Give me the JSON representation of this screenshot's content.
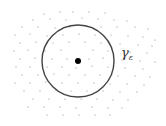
{
  "diagram": {
    "circle": {
      "cx": 78,
      "cy": 61,
      "r": 36,
      "stroke": "#444444",
      "label": "γ",
      "label_sub": "ε"
    },
    "center_point": {
      "cx": 78,
      "cy": 61,
      "r": 3,
      "fill": "#000000"
    },
    "scatter_color": "#888888",
    "scatter_points": [
      [
        44,
        14
      ],
      [
        60,
        12
      ],
      [
        73,
        12
      ],
      [
        89,
        12
      ],
      [
        105,
        13
      ],
      [
        33,
        20
      ],
      [
        50,
        19
      ],
      [
        66,
        20
      ],
      [
        82,
        18
      ],
      [
        98,
        19
      ],
      [
        114,
        20
      ],
      [
        127,
        21
      ],
      [
        22,
        27
      ],
      [
        38,
        27
      ],
      [
        55,
        28
      ],
      [
        70,
        27
      ],
      [
        86,
        26
      ],
      [
        101,
        27
      ],
      [
        117,
        27
      ],
      [
        135,
        27
      ],
      [
        148,
        29
      ],
      [
        15,
        35
      ],
      [
        30,
        34
      ],
      [
        47,
        36
      ],
      [
        63,
        35
      ],
      [
        79,
        34
      ],
      [
        95,
        35
      ],
      [
        111,
        35
      ],
      [
        128,
        36
      ],
      [
        143,
        37
      ],
      [
        155,
        40
      ],
      [
        20,
        43
      ],
      [
        36,
        42
      ],
      [
        53,
        43
      ],
      [
        69,
        42
      ],
      [
        85,
        42
      ],
      [
        101,
        43
      ],
      [
        120,
        44
      ],
      [
        138,
        45
      ],
      [
        152,
        46
      ],
      [
        14,
        51
      ],
      [
        28,
        50
      ],
      [
        45,
        51
      ],
      [
        61,
        50
      ],
      [
        93,
        50
      ],
      [
        108,
        51
      ],
      [
        130,
        52
      ],
      [
        147,
        53
      ],
      [
        20,
        59
      ],
      [
        35,
        58
      ],
      [
        52,
        59
      ],
      [
        67,
        59
      ],
      [
        89,
        59
      ],
      [
        103,
        58
      ],
      [
        122,
        60
      ],
      [
        140,
        61
      ],
      [
        155,
        62
      ],
      [
        16,
        67
      ],
      [
        30,
        67
      ],
      [
        47,
        67
      ],
      [
        62,
        67
      ],
      [
        76,
        68
      ],
      [
        92,
        66
      ],
      [
        108,
        67
      ],
      [
        125,
        68
      ],
      [
        143,
        69
      ],
      [
        22,
        75
      ],
      [
        38,
        75
      ],
      [
        54,
        74
      ],
      [
        69,
        75
      ],
      [
        85,
        75
      ],
      [
        100,
        75
      ],
      [
        118,
        76
      ],
      [
        135,
        76
      ],
      [
        150,
        77
      ],
      [
        15,
        83
      ],
      [
        30,
        83
      ],
      [
        46,
        82
      ],
      [
        62,
        83
      ],
      [
        78,
        83
      ],
      [
        94,
        83
      ],
      [
        110,
        84
      ],
      [
        127,
        84
      ],
      [
        144,
        85
      ],
      [
        24,
        91
      ],
      [
        40,
        91
      ],
      [
        56,
        90
      ],
      [
        71,
        91
      ],
      [
        87,
        91
      ],
      [
        103,
        91
      ],
      [
        120,
        92
      ],
      [
        137,
        92
      ],
      [
        33,
        99
      ],
      [
        49,
        99
      ],
      [
        65,
        99
      ],
      [
        81,
        99
      ],
      [
        97,
        99
      ],
      [
        113,
        100
      ],
      [
        128,
        100
      ],
      [
        28,
        107
      ],
      [
        44,
        107
      ],
      [
        60,
        107
      ],
      [
        76,
        108
      ],
      [
        92,
        107
      ],
      [
        108,
        108
      ],
      [
        122,
        108
      ],
      [
        47,
        115
      ],
      [
        63,
        115
      ],
      [
        79,
        115
      ],
      [
        95,
        115
      ],
      [
        110,
        115
      ]
    ]
  }
}
